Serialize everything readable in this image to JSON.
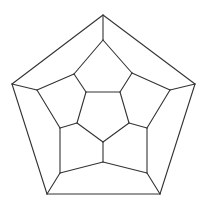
{
  "diagram": {
    "type": "graph",
    "line_color": "#333333",
    "background": "#ffffff",
    "vertices": {
      "outer": [
        "o0",
        "o1",
        "o2",
        "o3",
        "o4"
      ],
      "middle": [
        "m0",
        "m1",
        "m2",
        "m3",
        "m4",
        "m5",
        "m6",
        "m7",
        "m8",
        "m9"
      ],
      "inner": [
        "i0",
        "i1",
        "i2",
        "i3",
        "i4"
      ]
    },
    "edges": [
      [
        "o0",
        "o1"
      ],
      [
        "o1",
        "o2"
      ],
      [
        "o2",
        "o3"
      ],
      [
        "o3",
        "o4"
      ],
      [
        "o4",
        "o0"
      ],
      [
        "o0",
        "m0"
      ],
      [
        "o1",
        "m2"
      ],
      [
        "o2",
        "m4"
      ],
      [
        "o3",
        "m6"
      ],
      [
        "o4",
        "m8"
      ],
      [
        "m0",
        "m1"
      ],
      [
        "m1",
        "m2"
      ],
      [
        "m2",
        "m3"
      ],
      [
        "m3",
        "m4"
      ],
      [
        "m4",
        "m5"
      ],
      [
        "m5",
        "m6"
      ],
      [
        "m6",
        "m7"
      ],
      [
        "m7",
        "m8"
      ],
      [
        "m8",
        "m9"
      ],
      [
        "m9",
        "m0"
      ],
      [
        "m1",
        "i1"
      ],
      [
        "m3",
        "i2"
      ],
      [
        "m5",
        "i3"
      ],
      [
        "m7",
        "i4"
      ],
      [
        "m9",
        "i0"
      ],
      [
        "i0",
        "i1"
      ],
      [
        "i1",
        "i2"
      ],
      [
        "i2",
        "i3"
      ],
      [
        "i3",
        "i4"
      ],
      [
        "i4",
        "i0"
      ]
    ]
  }
}
